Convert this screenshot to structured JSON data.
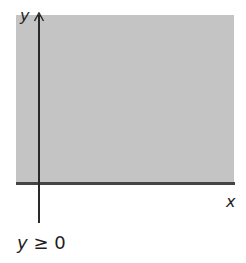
{
  "diagram": {
    "type": "half-plane inequality region",
    "x_axis_label": "x",
    "y_axis_label": "y",
    "condition": "y ≥ 0",
    "shaded_region": "upper half-plane (on and above x-axis)",
    "colors": {
      "shade": "#c4c4c4",
      "axis": "#2a2a2a",
      "boundary": "#444444",
      "text": "#1e1e1e"
    }
  }
}
